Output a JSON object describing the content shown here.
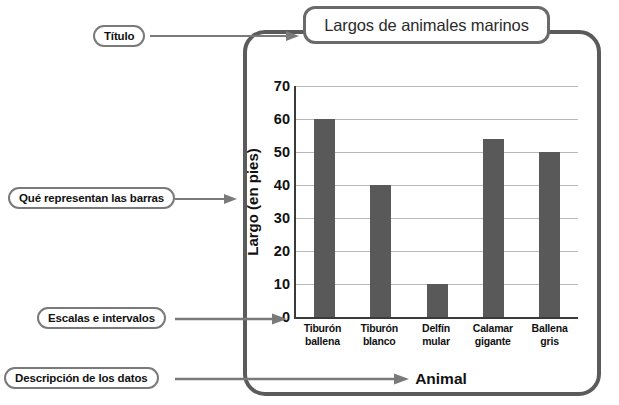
{
  "chart_data": {
    "type": "bar",
    "title": "Largos de animales marinos",
    "xlabel": "Animal",
    "ylabel": "Largo (en pies)",
    "categories": [
      "Tiburón ballena",
      "Tiburón blanco",
      "Delfín mular",
      "Calamar gigante",
      "Ballena gris"
    ],
    "category_lines": [
      [
        "Tiburón",
        "ballena"
      ],
      [
        "Tiburón",
        "blanco"
      ],
      [
        "Delfín",
        "mular"
      ],
      [
        "Calamar",
        "gigante"
      ],
      [
        "Ballena",
        "gris"
      ]
    ],
    "values": [
      60,
      40,
      10,
      54,
      50
    ],
    "ylim": [
      0,
      70
    ],
    "ytick_step": 10,
    "yticks": [
      0,
      10,
      20,
      30,
      40,
      50,
      60,
      70
    ],
    "grid": true,
    "legend": "none",
    "bar_color": "#595959",
    "gridline_color": "#b8b8b8",
    "axis_color": "#3a3a3a"
  },
  "annotations": {
    "title_callout": "Título",
    "bars_callout": "Qué representan las barras",
    "scales_callout": "Escalas e intervalos",
    "data_callout": "Descripción de los datos"
  },
  "colors": {
    "frame": "#5b5b5b",
    "callout_border": "#7a7a7a",
    "leader": "#7a7a7a",
    "text": "#111111"
  }
}
